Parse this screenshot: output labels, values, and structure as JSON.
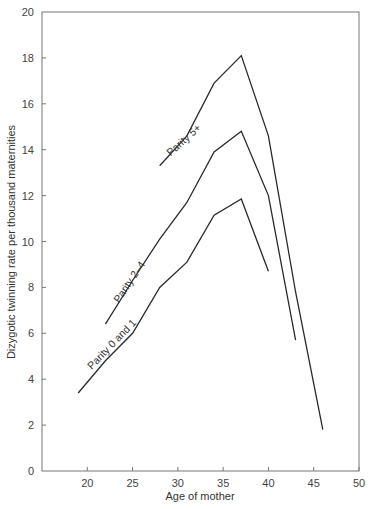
{
  "chart_data": {
    "type": "line",
    "title": "",
    "xlabel": "Age of mother",
    "ylabel": "Dizygotic twinning rate per thousand maternities",
    "xlim": [
      15,
      50
    ],
    "ylim": [
      0,
      20
    ],
    "xticks": [
      20,
      25,
      30,
      35,
      40,
      45,
      50
    ],
    "yticks": [
      0,
      2,
      4,
      6,
      8,
      10,
      12,
      14,
      16,
      18,
      20
    ],
    "grid": false,
    "legend": "inline labels along lines",
    "series": [
      {
        "name": "Parity 0 and 1",
        "x": [
          19,
          22,
          25,
          28,
          31,
          34,
          37,
          40
        ],
        "values": [
          3.4,
          4.8,
          6.0,
          8.0,
          9.1,
          11.15,
          11.85,
          8.7
        ],
        "label_at": [
          20.5,
          4.4
        ],
        "label_angle": -46
      },
      {
        "name": "Parity 2–4",
        "x": [
          22,
          25,
          28,
          31,
          34,
          37,
          40,
          43
        ],
        "values": [
          6.4,
          8.3,
          10.1,
          11.7,
          13.9,
          14.8,
          12.0,
          5.7
        ],
        "label_at": [
          23.5,
          7.3
        ],
        "label_angle": -56
      },
      {
        "name": "Parity 5+",
        "x": [
          28,
          31,
          34,
          37,
          40,
          43,
          46
        ],
        "values": [
          13.3,
          14.6,
          16.9,
          18.1,
          14.6,
          7.8,
          1.8
        ],
        "label_at": [
          29.2,
          13.7
        ],
        "label_angle": -42
      }
    ]
  },
  "axes": {
    "x_label": "Age of mother",
    "y_label": "Dizygotic twinning rate per thousand maternities"
  }
}
